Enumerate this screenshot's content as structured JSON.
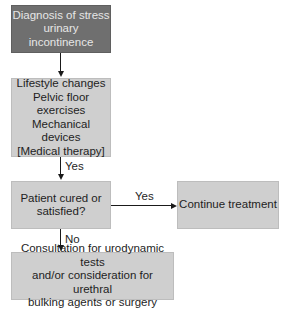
{
  "diagram": {
    "nodes": [
      {
        "id": "diagnosis",
        "lines": [
          "Diagnosis of stress",
          "urinary incontinence"
        ]
      },
      {
        "id": "conservative",
        "lines": [
          "Lifestyle changes",
          "Pelvic floor",
          "exercises",
          "Mechanical devices",
          "[Medical therapy]"
        ]
      },
      {
        "id": "decision",
        "lines": [
          "Patient cured or",
          "satisfied?"
        ]
      },
      {
        "id": "continue",
        "lines": [
          "Continue treatment"
        ]
      },
      {
        "id": "consultation",
        "lines": [
          "Consultation for urodynamic tests",
          "and/or consideration for urethral",
          "bulking agents or surgery"
        ]
      }
    ],
    "edges": [
      {
        "from": "diagnosis",
        "to": "conservative",
        "label": ""
      },
      {
        "from": "conservative",
        "to": "decision",
        "label": "Yes"
      },
      {
        "from": "decision",
        "to": "continue",
        "label": "Yes"
      },
      {
        "from": "decision",
        "to": "consultation",
        "label": "No"
      }
    ],
    "colors": {
      "dark_box": "#6f6f6f",
      "light_box": "#cfcfcf",
      "line": "#1a1a1a"
    }
  }
}
